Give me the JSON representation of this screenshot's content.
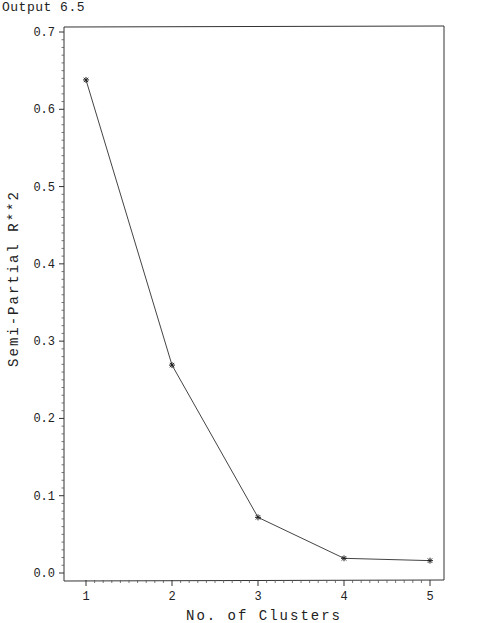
{
  "caption": "Output 6.5",
  "chart_data": {
    "type": "line",
    "title": "",
    "xlabel": "No. of Clusters",
    "ylabel": "Semi-Partial R**2",
    "x": [
      1,
      2,
      3,
      4,
      5
    ],
    "series": [
      {
        "name": "Semi-Partial R**2",
        "values": [
          0.638,
          0.269,
          0.072,
          0.019,
          0.016
        ],
        "marker": "*"
      }
    ],
    "xticks": [
      "1",
      "2",
      "3",
      "4",
      "5"
    ],
    "yticks": [
      "0.0",
      "0.1",
      "0.2",
      "0.3",
      "0.4",
      "0.5",
      "0.6",
      "0.7"
    ],
    "xlim": [
      1,
      5
    ],
    "ylim": [
      0,
      0.7
    ],
    "grid": false,
    "legend": "none"
  }
}
